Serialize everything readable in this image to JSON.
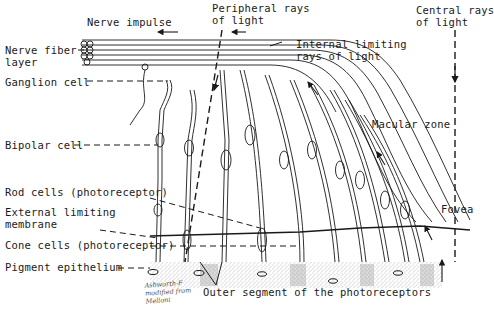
{
  "figure": {
    "labels": {
      "nerve_impulse": "Nerve impulse",
      "peripheral_rays": "Peripheral rays\nof light",
      "central_rays": "Central rays\nof light",
      "nerve_fiber_layer": "Nerve fiber\nlayer",
      "internal_limiting": "Internal limiting\nrays of light",
      "ganglion_cell": "Ganglion cell",
      "bipolar_cell": "Bipolar cell",
      "macular_zone": "Macular zone",
      "rod_cells": "Rod cells (photoreceptor)",
      "external_limiting": "External limiting\nmembrane",
      "fovea": "Fovea",
      "cone_cells": "Cone cells (photoreceptor)",
      "pigment_epithelium": "Pigment epithelium",
      "outer_segment": "Outer segment of the photoreceptors"
    },
    "signature": "Ashworth-F\nmodified from\nMelloni",
    "colors": {
      "ink": "#1a1a1a",
      "background": "#ffffff",
      "stipple": "#8a8a8a"
    }
  }
}
